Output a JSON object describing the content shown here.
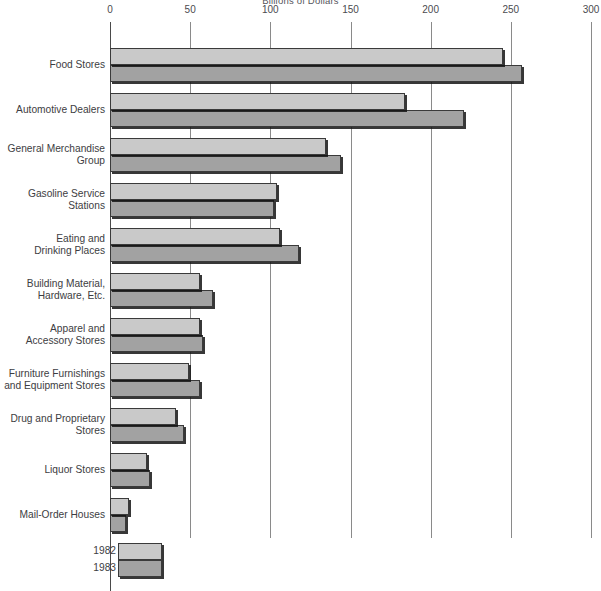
{
  "chart_data": {
    "type": "bar",
    "orientation": "horizontal",
    "title": "Billions of Dollars",
    "xlabel": "",
    "ylabel": "",
    "xlim": [
      0,
      300
    ],
    "xticks": [
      0,
      50,
      100,
      150,
      200,
      250,
      300
    ],
    "grid": true,
    "legend_position": "bottom-left",
    "categories": [
      "Food Stores",
      "Automotive Dealers",
      "General Merchandise\nGroup",
      "Gasoline Service\nStations",
      "Eating and\nDrinking Places",
      "Building Material,\nHardware, Etc.",
      "Apparel and\nAccessory Stores",
      "Furniture Furnishings\nand Equipment Stores",
      "Drug and Proprietary\nStores",
      "Liquor Stores",
      "Mail-Order Houses"
    ],
    "series": [
      {
        "name": "1982",
        "color": "#c9c9c9",
        "values": [
          245,
          184,
          135,
          104,
          106,
          56,
          56,
          49,
          41,
          23,
          12
        ]
      },
      {
        "name": "1983",
        "color": "#a2a2a2",
        "values": [
          257,
          221,
          144,
          102,
          118,
          64,
          58,
          56,
          46,
          25,
          10
        ]
      }
    ]
  },
  "legend": {
    "items": [
      {
        "label": "1982",
        "color": "#c9c9c9"
      },
      {
        "label": "1983",
        "color": "#a2a2a2"
      }
    ]
  }
}
